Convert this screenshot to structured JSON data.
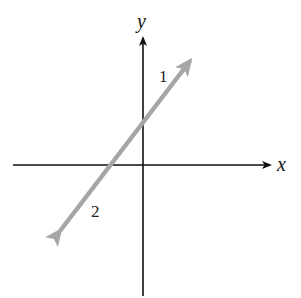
{
  "diagram": {
    "type": "coordinate-plane-with-line",
    "axes": {
      "x_label": "x",
      "y_label": "y",
      "color": "#111111"
    },
    "line": {
      "color": "#a6a6a6",
      "description": "double-headed line with positive slope, crossing negative x-axis and positive y-axis",
      "direction_labels": {
        "upper_right": "1",
        "lower_left": "2"
      }
    }
  }
}
